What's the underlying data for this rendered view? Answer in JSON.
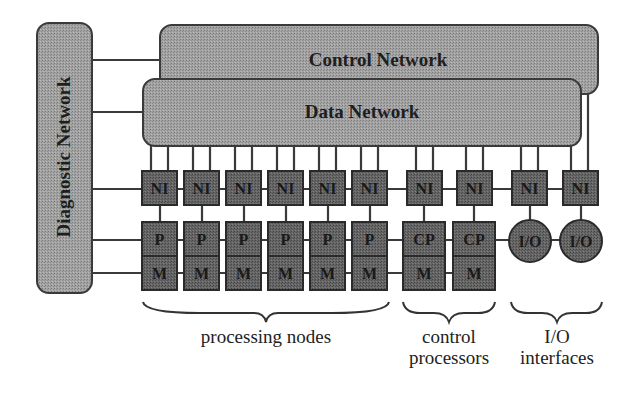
{
  "networks": {
    "control": {
      "label": "Control Network"
    },
    "data": {
      "label": "Data Network"
    },
    "diagnostic": {
      "label": "Diagnostic Network"
    }
  },
  "node_labels": {
    "network_interface": "NI",
    "processor": "P",
    "memory": "M",
    "control_processor": "CP",
    "io": "I/O"
  },
  "groups": [
    {
      "id": "processing",
      "label_lines": [
        "processing nodes"
      ],
      "count": 6
    },
    {
      "id": "control",
      "label_lines": [
        "control",
        "processors"
      ],
      "count": 2
    },
    {
      "id": "io",
      "label_lines": [
        "I/O",
        "interfaces"
      ],
      "count": 2
    }
  ],
  "colors": {
    "box_fill": "#5a5a5a",
    "network_fill": "#9a9a9a",
    "line": "#3a3a3a",
    "background": "#ffffff"
  }
}
